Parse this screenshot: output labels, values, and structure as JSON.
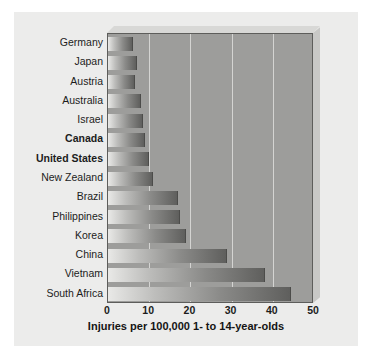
{
  "chart_data": {
    "type": "bar",
    "orientation": "horizontal",
    "title": "",
    "xlabel": "Injuries per 100,000 1- to 14-year-olds",
    "ylabel": "",
    "xlim": [
      0,
      50
    ],
    "xticks": [
      0,
      10,
      20,
      30,
      40,
      50
    ],
    "grid": true,
    "legend": false,
    "categories": [
      "Germany",
      "Japan",
      "Austria",
      "Australia",
      "Israel",
      "Canada",
      "United States",
      "New Zealand",
      "Brazil",
      "Philippines",
      "Korea",
      "China",
      "Vietnam",
      "South Africa"
    ],
    "values": [
      6,
      7,
      6.5,
      8,
      8.5,
      9,
      10,
      11,
      17,
      17.5,
      19,
      29,
      38,
      44.5
    ],
    "highlighted": [
      "Canada",
      "United States"
    ],
    "bar_gradient": [
      "#e9e9e7",
      "#5f5f5d"
    ],
    "plot_background": "#9d9d9b",
    "card_background": "#ececeb",
    "gridline_color": "#d4d4d2"
  }
}
